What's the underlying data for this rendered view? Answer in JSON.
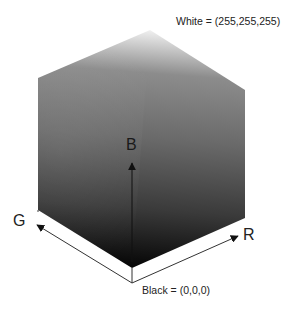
{
  "diagram": {
    "labels": {
      "white": "White = (255,255,255)",
      "black": "Black = (0,0,0)",
      "axis_b": "B",
      "axis_g": "G",
      "axis_r": "R"
    },
    "colors": {
      "top_vertex": "#f2f2f2",
      "mid_gray": "#6e6e6e",
      "bottom_vertex": "#050505",
      "axis_line": "#222222"
    },
    "vertices": {
      "top": [
        150,
        30
      ],
      "upper_left": [
        38,
        78
      ],
      "upper_right": [
        245,
        90
      ],
      "lower_left": [
        38,
        210
      ],
      "lower_right": [
        245,
        218
      ],
      "bottom": [
        132,
        268
      ],
      "origin": [
        132,
        283
      ]
    }
  }
}
